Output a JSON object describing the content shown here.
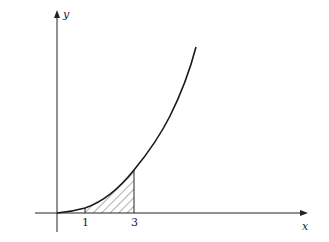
{
  "figure": {
    "type": "function-plot",
    "function_shape": "increasing convex curve (y = x^2 like)",
    "axes": {
      "x_label": "x",
      "y_label": "y"
    },
    "ticks": [
      {
        "value": 1,
        "label": "1"
      },
      {
        "value": 3,
        "label": "3"
      }
    ],
    "shaded_region": {
      "from": 1,
      "to": 3,
      "style": "diagonal hatching",
      "description": "area under curve between x=1 and x=3"
    },
    "colors": {
      "line": "#1a1a1a",
      "background": "#ffffff"
    }
  }
}
